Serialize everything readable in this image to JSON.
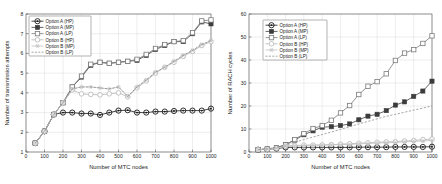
{
  "figure": {
    "title": "",
    "panels": [
      "left",
      "right"
    ]
  },
  "chart_data": [
    {
      "type": "line",
      "panel": "left",
      "title": "",
      "xlabel": "Number of MTC nodes",
      "ylabel": "Number of transmission attempts",
      "xlim": [
        0,
        1000
      ],
      "ylim": [
        1,
        8
      ],
      "xticks": [
        0,
        100,
        200,
        300,
        400,
        500,
        600,
        700,
        800,
        900,
        1000
      ],
      "yticks": [
        1,
        2,
        3,
        4,
        5,
        6,
        7,
        8
      ],
      "grid": true,
      "legend_position": "upper-left",
      "x": [
        50,
        100,
        150,
        200,
        250,
        300,
        350,
        400,
        450,
        500,
        550,
        600,
        650,
        700,
        750,
        800,
        850,
        900,
        950,
        1000
      ],
      "series": [
        {
          "name": "Option A (HP)",
          "marker": "circle-dot",
          "color": "#1a1a1a",
          "values": [
            1.45,
            2.05,
            2.9,
            3.0,
            3.0,
            2.95,
            2.95,
            2.88,
            3.0,
            3.1,
            3.12,
            3.0,
            3.0,
            3.05,
            3.05,
            3.08,
            3.1,
            3.1,
            3.1,
            3.2
          ]
        },
        {
          "name": "Option A (MP)",
          "marker": "filled-square",
          "color": "#3c3c3c",
          "values": [
            1.45,
            2.05,
            2.9,
            3.5,
            4.3,
            4.8,
            5.4,
            5.55,
            5.5,
            5.55,
            5.6,
            5.65,
            5.9,
            6.2,
            6.4,
            6.6,
            6.6,
            7.0,
            7.6,
            7.5
          ]
        },
        {
          "name": "Option A (LP)",
          "marker": "open-square",
          "color": "#7a7a7a",
          "values": [
            1.45,
            2.05,
            2.9,
            3.5,
            4.3,
            4.85,
            5.45,
            5.55,
            5.5,
            5.55,
            5.6,
            5.7,
            5.95,
            6.25,
            6.45,
            6.6,
            6.65,
            7.05,
            7.65,
            7.7
          ]
        },
        {
          "name": "Option B (HP)",
          "marker": "open-circle",
          "color": "#b5b5b5",
          "values": [
            1.45,
            2.05,
            2.9,
            3.5,
            4.15,
            3.95,
            3.92,
            3.9,
            3.95,
            4.0,
            3.8,
            4.25,
            4.6,
            5.0,
            5.3,
            5.55,
            5.85,
            6.1,
            6.4,
            6.6
          ]
        },
        {
          "name": "Option B (MP)",
          "marker": "star",
          "color": "#c2c2c2",
          "values": [
            1.45,
            2.05,
            2.9,
            3.5,
            4.2,
            4.3,
            4.3,
            4.25,
            4.2,
            4.3,
            3.82,
            4.3,
            4.65,
            5.05,
            5.3,
            5.6,
            5.9,
            6.15,
            6.45,
            6.65
          ]
        },
        {
          "name": "Option B (LP)",
          "marker": "none",
          "color": "#8f8f8f",
          "values": [
            1.45,
            2.05,
            2.9,
            3.5,
            4.2,
            4.3,
            4.3,
            4.25,
            4.2,
            4.3,
            3.82,
            4.3,
            4.65,
            5.05,
            5.3,
            5.6,
            5.9,
            6.15,
            6.45,
            6.65
          ]
        }
      ]
    },
    {
      "type": "line",
      "panel": "right",
      "title": "",
      "xlabel": "Number of MTC nodes",
      "ylabel": "Number of RACH cycles",
      "xlim": [
        0,
        1000
      ],
      "ylim": [
        0,
        60
      ],
      "xticks": [
        0,
        100,
        200,
        300,
        400,
        500,
        600,
        700,
        800,
        900,
        1000
      ],
      "yticks": [
        0,
        10,
        20,
        30,
        40,
        50,
        60
      ],
      "grid": true,
      "legend_position": "upper-left",
      "x": [
        50,
        100,
        150,
        200,
        250,
        300,
        350,
        400,
        450,
        500,
        550,
        600,
        650,
        700,
        750,
        800,
        850,
        900,
        950,
        1000
      ],
      "series": [
        {
          "name": "Option A (HP)",
          "marker": "circle-dot",
          "color": "#1a1a1a",
          "values": [
            1.0,
            1.2,
            1.5,
            2.0,
            2.0,
            2.0,
            2.0,
            2.0,
            2.0,
            2.0,
            2.0,
            2.1,
            2.1,
            2.1,
            2.1,
            2.2,
            2.2,
            2.2,
            2.2,
            2.3
          ]
        },
        {
          "name": "Option A (MP)",
          "marker": "filled-square",
          "color": "#3c3c3c",
          "values": [
            1.0,
            1.3,
            1.8,
            3.2,
            5.2,
            7.5,
            9.2,
            10.8,
            11.0,
            11.5,
            12.2,
            14.0,
            15.6,
            16.4,
            18.0,
            20.4,
            21.8,
            24.2,
            26.5,
            30.8
          ]
        },
        {
          "name": "Option A (LP)",
          "marker": "open-square",
          "color": "#7a7a7a",
          "values": [
            1.0,
            1.3,
            1.8,
            3.2,
            5.4,
            8.0,
            10.2,
            11.5,
            13.8,
            17.0,
            20.2,
            25.0,
            28.6,
            30.6,
            34.0,
            39.8,
            43.0,
            44.5,
            47.2,
            50.5
          ]
        },
        {
          "name": "Option B (HP)",
          "marker": "open-circle",
          "color": "#b5b5b5",
          "values": [
            1.0,
            1.2,
            1.6,
            2.6,
            2.8,
            3.0,
            3.0,
            3.1,
            3.2,
            3.4,
            3.6,
            3.8,
            4.0,
            4.2,
            4.4,
            4.5,
            4.8,
            5.0,
            5.4,
            5.6
          ]
        },
        {
          "name": "Option B (MP)",
          "marker": "star",
          "color": "#c2c2c2",
          "values": [
            1.0,
            1.2,
            1.6,
            2.4,
            2.6,
            2.8,
            2.9,
            3.0,
            3.1,
            3.2,
            3.3,
            3.5,
            3.7,
            3.9,
            4.0,
            4.2,
            4.4,
            4.6,
            4.8,
            5.0
          ]
        },
        {
          "name": "Option B (LP)",
          "marker": "none",
          "color": "#8f8f8f",
          "values": [
            1.0,
            1.4,
            2.0,
            3.0,
            4.2,
            5.4,
            6.5,
            7.6,
            8.7,
            9.8,
            11.0,
            12.2,
            13.3,
            14.4,
            15.5,
            16.4,
            17.3,
            18.2,
            19.1,
            20.0
          ]
        }
      ]
    }
  ]
}
